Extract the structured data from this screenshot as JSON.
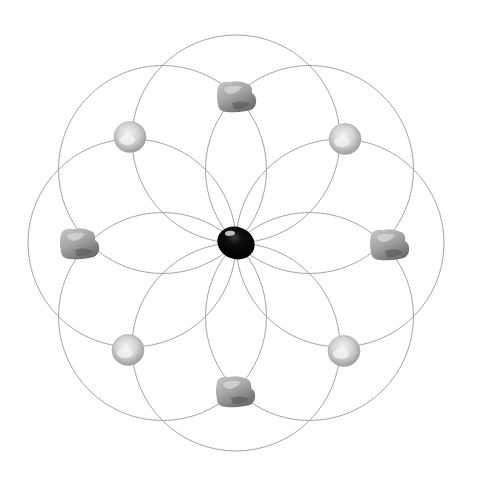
{
  "diagram": {
    "type": "crystal-grid",
    "background": "#ffffff",
    "line_color": "#9a9a9a",
    "center": {
      "x": 236,
      "y": 243
    },
    "circle_radius": 104,
    "circle_count": 8,
    "circles": [
      {
        "angle_deg": 0
      },
      {
        "angle_deg": 45
      },
      {
        "angle_deg": 90
      },
      {
        "angle_deg": 135
      },
      {
        "angle_deg": 180
      },
      {
        "angle_deg": 225
      },
      {
        "angle_deg": 270
      },
      {
        "angle_deg": 315
      }
    ],
    "center_stone": {
      "name": "black-tumbled-stone",
      "x": 236,
      "y": 243,
      "rx": 19,
      "ry": 16,
      "rotate": 20,
      "color": "#0a0a0a"
    },
    "stones": [
      {
        "name": "rough-stone-top",
        "shape": "rough",
        "x": 236,
        "y": 97
      },
      {
        "name": "round-stone-top-right",
        "shape": "round",
        "x": 345,
        "y": 139
      },
      {
        "name": "rough-stone-right",
        "shape": "rough",
        "x": 389,
        "y": 245
      },
      {
        "name": "round-stone-bottom-right",
        "shape": "round",
        "x": 344,
        "y": 351
      },
      {
        "name": "rough-stone-bottom",
        "shape": "rough",
        "x": 235,
        "y": 392
      },
      {
        "name": "round-stone-bottom-left",
        "shape": "round",
        "x": 128,
        "y": 350
      },
      {
        "name": "rough-stone-left",
        "shape": "rough",
        "x": 79,
        "y": 244
      },
      {
        "name": "round-stone-top-left",
        "shape": "round",
        "x": 130,
        "y": 137
      }
    ]
  }
}
